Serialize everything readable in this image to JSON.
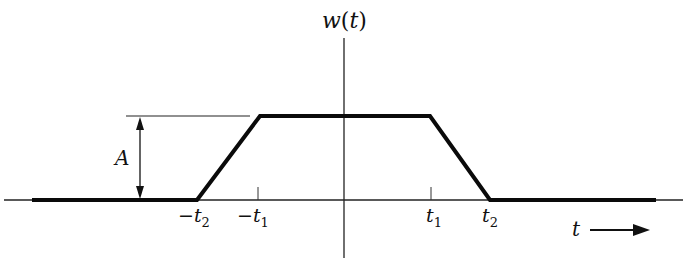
{
  "diagram": {
    "type": "trapezoidal-pulse",
    "y_axis_label": {
      "func": "w",
      "open": "(",
      "var": "t",
      "close": ")"
    },
    "x_axis_label": "t",
    "amplitude_label": "A",
    "tick_labels": {
      "neg_t2": {
        "sign": "−",
        "var": "t",
        "sub": "2"
      },
      "neg_t1": {
        "sign": "−",
        "var": "t",
        "sub": "1"
      },
      "t1": {
        "var": "t",
        "sub": "1"
      },
      "t2": {
        "var": "t",
        "sub": "2"
      }
    },
    "colors": {
      "line": "#111111",
      "background": "#ffffff"
    }
  }
}
